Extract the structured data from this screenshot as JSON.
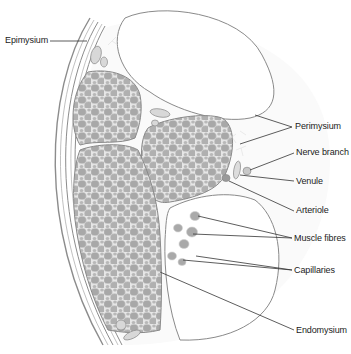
{
  "diagram": {
    "colors": {
      "background": "#ffffff",
      "outline": "#8a8a8a",
      "fibre_fill": "#a9a9a9",
      "fascicle_fill": "#e4e4e4",
      "leader_line": "#333333",
      "label_text": "#222222"
    },
    "labels": [
      {
        "id": "epimysium",
        "text": "Epimysium"
      },
      {
        "id": "perimysium",
        "text": "Perimysium"
      },
      {
        "id": "nerve-branch",
        "text": "Nerve branch"
      },
      {
        "id": "venule",
        "text": "Venule"
      },
      {
        "id": "arteriole",
        "text": "Arteriole"
      },
      {
        "id": "muscle-fibres",
        "text": "Muscle fibres"
      },
      {
        "id": "capillaries",
        "text": "Capillaries"
      },
      {
        "id": "endomysium",
        "text": "Endomysium"
      }
    ]
  }
}
